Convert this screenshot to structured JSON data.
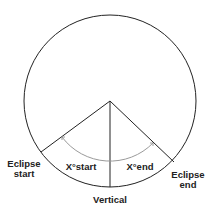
{
  "diagram": {
    "labels": {
      "eclipse_start": "Eclipse\nstart",
      "eclipse_start_line1": "Eclipse",
      "eclipse_start_line2": "start",
      "eclipse_end_line1": "Eclipse",
      "eclipse_end_line2": "end",
      "x_start": "X°start",
      "x_end": "X°end",
      "vertical": "Vertical"
    },
    "colors": {
      "line": "#222222",
      "arc": "#9a9a9a",
      "background": "#ffffff"
    }
  }
}
